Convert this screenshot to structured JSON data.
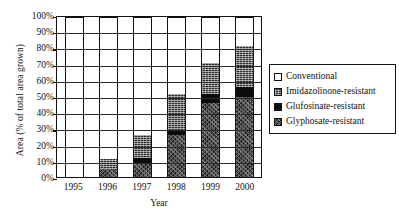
{
  "chart_data": {
    "type": "bar",
    "stacked": true,
    "title": "",
    "xlabel": "Year",
    "ylabel": "Area (% of total area grown)",
    "categories": [
      "1995",
      "1996",
      "1997",
      "1998",
      "1999",
      "2000"
    ],
    "ylim": [
      0,
      100
    ],
    "ytick_labels": [
      "0%",
      "10%",
      "20%",
      "30%",
      "40%",
      "50%",
      "60%",
      "70%",
      "80%",
      "90%",
      "100%"
    ],
    "ytick_values": [
      0,
      10,
      20,
      30,
      40,
      50,
      60,
      70,
      80,
      90,
      100
    ],
    "grid": true,
    "legend_position": "right",
    "series": [
      {
        "name": "Glyphosate-resistant",
        "pattern": "dark-speckled",
        "values": [
          0,
          5,
          9,
          26,
          46,
          50
        ]
      },
      {
        "name": "Glufosinate-resistant",
        "pattern": "solid-black",
        "values": [
          0,
          0,
          3,
          3,
          6,
          6
        ]
      },
      {
        "name": "Imidazolinone-resistant",
        "pattern": "dark-hatched",
        "values": [
          0,
          6,
          14,
          23,
          19,
          26
        ]
      },
      {
        "name": "Conventional",
        "pattern": "white",
        "values": [
          100,
          89,
          74,
          48,
          29,
          18
        ]
      }
    ],
    "annotations": []
  },
  "legend": {
    "items": [
      {
        "label": "Conventional",
        "swatch": "conventional-swatch"
      },
      {
        "label": "Imidazolinone-resistant",
        "swatch": "imidazolinone-swatch"
      },
      {
        "label": "Glufosinate-resistant",
        "swatch": "glufosinate-swatch"
      },
      {
        "label": "Glyphosate-resistant",
        "swatch": "glyphosate-swatch"
      }
    ]
  },
  "colors": {
    "axis": "#111111",
    "conventional": "#ffffff",
    "imidazolinone": "#2e2e2e",
    "glufosinate": "#0d0d0d",
    "glyphosate": "#3a3a3a",
    "background": "#ffffff"
  }
}
